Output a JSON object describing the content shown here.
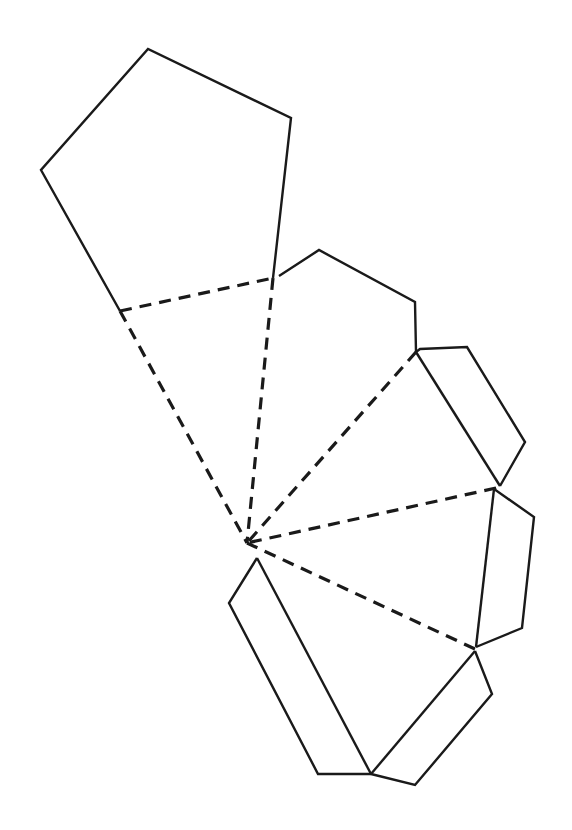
{
  "diagram": {
    "type": "pentagonal-pyramid-net",
    "colors": {
      "background": "#ffffff",
      "stroke": "#1a1a1a"
    },
    "apex": [
      247,
      543
    ],
    "base_pentagon": [
      [
        148,
        49
      ],
      [
        291,
        118
      ],
      [
        273,
        278
      ],
      [
        120,
        311
      ],
      [
        41,
        170
      ]
    ],
    "fold_lines": [
      [
        [
          120,
          311
        ],
        [
          273,
          278
        ]
      ],
      [
        [
          120,
          311
        ],
        [
          247,
          543
        ]
      ],
      [
        [
          273,
          278
        ],
        [
          247,
          543
        ]
      ],
      [
        [
          416,
          352
        ],
        [
          247,
          543
        ]
      ],
      [
        [
          496,
          488
        ],
        [
          247,
          543
        ]
      ],
      [
        [
          475,
          649
        ],
        [
          247,
          543
        ]
      ]
    ],
    "faces": [
      [
        [
          273,
          278
        ],
        [
          416,
          352
        ],
        [
          247,
          543
        ]
      ],
      [
        [
          416,
          352
        ],
        [
          496,
          488
        ],
        [
          247,
          543
        ]
      ],
      [
        [
          496,
          488
        ],
        [
          475,
          649
        ],
        [
          247,
          543
        ]
      ],
      [
        [
          475,
          649
        ],
        [
          371,
          774
        ],
        [
          247,
          543
        ]
      ]
    ],
    "tabs": [
      [
        [
          279,
          276
        ],
        [
          319,
          250
        ],
        [
          415,
          302
        ],
        [
          416,
          352
        ]
      ],
      [
        [
          420,
          349
        ],
        [
          467,
          347
        ],
        [
          525,
          442
        ],
        [
          500,
          486
        ]
      ],
      [
        [
          494,
          489
        ],
        [
          534,
          517
        ],
        [
          522,
          628
        ],
        [
          476,
          647
        ]
      ],
      [
        [
          475,
          651
        ],
        [
          492,
          694
        ],
        [
          415,
          785
        ],
        [
          371,
          774
        ]
      ],
      [
        [
          257,
          558
        ],
        [
          229,
          603
        ],
        [
          318,
          774
        ],
        [
          371,
          774
        ]
      ]
    ]
  }
}
